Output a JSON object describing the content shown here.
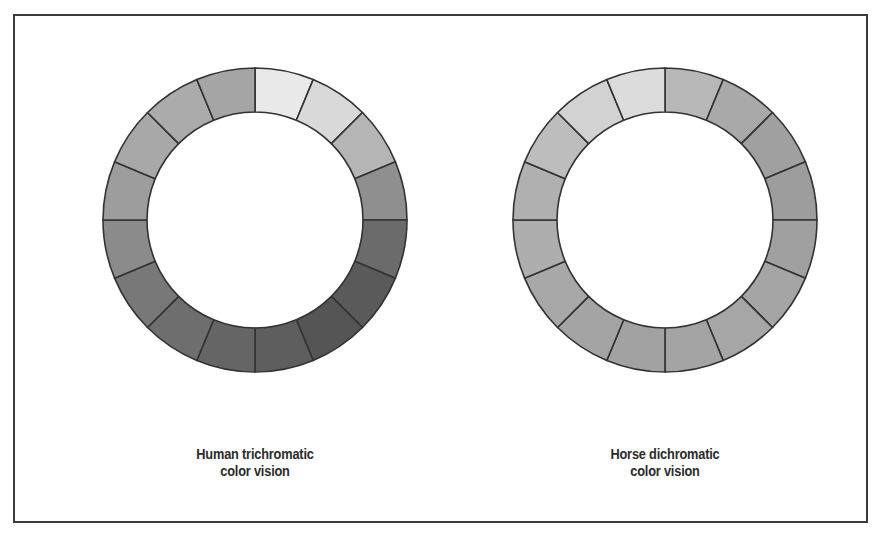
{
  "figure": {
    "background": "#ffffff",
    "frame_color": "#3c3c3c",
    "segment_stroke": "#333333",
    "segment_count": 16
  },
  "panels": [
    {
      "id": "human",
      "caption_line1": "Human trichromatic",
      "caption_line2": "color vision",
      "wheel_name": "human-trichromatic-color-wheel",
      "outer_radius": 152,
      "inner_radius": 108,
      "start_angle_deg": -90,
      "segments": [
        {
          "index": 0,
          "label": "yellow",
          "color": "#e9e9e9"
        },
        {
          "index": 1,
          "label": "yellow-green",
          "color": "#d9d9d9"
        },
        {
          "index": 2,
          "label": "green-yellow",
          "color": "#b5b5b5"
        },
        {
          "index": 3,
          "label": "green",
          "color": "#8f8f8f"
        },
        {
          "index": 4,
          "label": "green-cyan",
          "color": "#6b6b6b"
        },
        {
          "index": 5,
          "label": "cyan",
          "color": "#5a5a5a"
        },
        {
          "index": 6,
          "label": "cyan-blue",
          "color": "#555555"
        },
        {
          "index": 7,
          "label": "blue",
          "color": "#5e5e5e"
        },
        {
          "index": 8,
          "label": "blue-violet",
          "color": "#656565"
        },
        {
          "index": 9,
          "label": "violet",
          "color": "#6e6e6e"
        },
        {
          "index": 10,
          "label": "magenta",
          "color": "#787878"
        },
        {
          "index": 11,
          "label": "red-magenta",
          "color": "#8b8b8b"
        },
        {
          "index": 12,
          "label": "red",
          "color": "#9d9d9d"
        },
        {
          "index": 13,
          "label": "red-orange",
          "color": "#a8a8a8"
        },
        {
          "index": 14,
          "label": "orange",
          "color": "#ababab"
        },
        {
          "index": 15,
          "label": "orange-yellow",
          "color": "#a5a5a5"
        }
      ]
    },
    {
      "id": "horse",
      "caption_line1": "Horse dichromatic",
      "caption_line2": "color vision",
      "wheel_name": "horse-dichromatic-color-wheel",
      "outer_radius": 152,
      "inner_radius": 108,
      "start_angle_deg": -90,
      "segments": [
        {
          "index": 0,
          "label": "yellow",
          "color": "#b8b8b8"
        },
        {
          "index": 1,
          "label": "yellow-green",
          "color": "#a9a9a9"
        },
        {
          "index": 2,
          "label": "green-yellow",
          "color": "#a0a0a0"
        },
        {
          "index": 3,
          "label": "green",
          "color": "#9d9d9d"
        },
        {
          "index": 4,
          "label": "green-cyan",
          "color": "#a0a0a0"
        },
        {
          "index": 5,
          "label": "cyan",
          "color": "#a5a5a5"
        },
        {
          "index": 6,
          "label": "cyan-blue",
          "color": "#a6a6a6"
        },
        {
          "index": 7,
          "label": "blue",
          "color": "#a4a4a4"
        },
        {
          "index": 8,
          "label": "blue-violet",
          "color": "#a2a2a2"
        },
        {
          "index": 9,
          "label": "violet",
          "color": "#a4a4a4"
        },
        {
          "index": 10,
          "label": "magenta",
          "color": "#a8a8a8"
        },
        {
          "index": 11,
          "label": "red-magenta",
          "color": "#aeaeae"
        },
        {
          "index": 12,
          "label": "red",
          "color": "#b0b0b0"
        },
        {
          "index": 13,
          "label": "red-orange",
          "color": "#bdbdbd"
        },
        {
          "index": 14,
          "label": "orange",
          "color": "#d2d2d2"
        },
        {
          "index": 15,
          "label": "orange-yellow",
          "color": "#dcdcdc"
        }
      ]
    }
  ]
}
